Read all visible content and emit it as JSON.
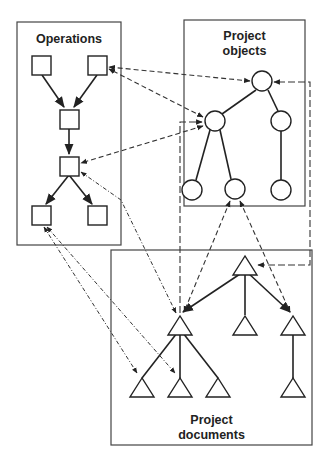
{
  "diagram": {
    "groups": [
      {
        "id": "operations",
        "label": "Operations",
        "shape": "square"
      },
      {
        "id": "objects",
        "label_line1": "Project",
        "label_line2": "objects",
        "shape": "circle"
      },
      {
        "id": "documents",
        "label_line1": "Project",
        "label_line2": "documents",
        "shape": "triangle"
      }
    ],
    "operations": {
      "title": "Operations",
      "nodes": [
        "op1",
        "op2",
        "op3",
        "op4",
        "op5",
        "op6"
      ],
      "edges": [
        [
          "op1",
          "op3"
        ],
        [
          "op2",
          "op3"
        ],
        [
          "op3",
          "op4"
        ],
        [
          "op4",
          "op5"
        ],
        [
          "op4",
          "op6"
        ]
      ]
    },
    "objects": {
      "title_line1": "Project",
      "title_line2": "objects",
      "nodes": [
        "obj1",
        "obj2",
        "obj3",
        "obj4",
        "obj5",
        "obj6"
      ],
      "edges": [
        [
          "obj1",
          "obj2"
        ],
        [
          "obj1",
          "obj3"
        ],
        [
          "obj2",
          "obj4"
        ],
        [
          "obj2",
          "obj5"
        ],
        [
          "obj3",
          "obj6"
        ]
      ]
    },
    "documents": {
      "title_line1": "Project",
      "title_line2": "documents",
      "nodes": [
        "doc1",
        "doc2",
        "doc3",
        "doc4",
        "doc5",
        "doc6",
        "doc7",
        "doc8"
      ],
      "edges": [
        [
          "doc1",
          "doc2"
        ],
        [
          "doc1",
          "doc3"
        ],
        [
          "doc1",
          "doc4"
        ],
        [
          "doc2",
          "doc5"
        ],
        [
          "doc2",
          "doc6"
        ],
        [
          "doc2",
          "doc7"
        ],
        [
          "doc4",
          "doc8"
        ]
      ]
    },
    "cross_links": [
      {
        "from": "obj1",
        "to": "op2",
        "style": "dashed",
        "bidirectional": true
      },
      {
        "from": "obj2",
        "to": "op2",
        "style": "dashed",
        "bidirectional": true
      },
      {
        "from": "obj2",
        "to": "op4",
        "style": "dashed",
        "bidirectional": true
      },
      {
        "from": "op4",
        "to": "doc2",
        "style": "dash-dot"
      },
      {
        "from": "op5",
        "to": "doc5",
        "style": "dash-dot",
        "bidirectional": true
      },
      {
        "from": "op5",
        "to": "doc6",
        "style": "dash-dot",
        "bidirectional": true
      },
      {
        "from": "obj5",
        "to": "doc2",
        "style": "dashed",
        "bidirectional": true
      },
      {
        "from": "obj5",
        "to": "doc4",
        "style": "dashed",
        "bidirectional": true
      },
      {
        "from": "doc2",
        "to": "obj2",
        "style": "long-dash"
      },
      {
        "from": "doc1",
        "to": "obj1",
        "style": "long-dash"
      }
    ]
  }
}
